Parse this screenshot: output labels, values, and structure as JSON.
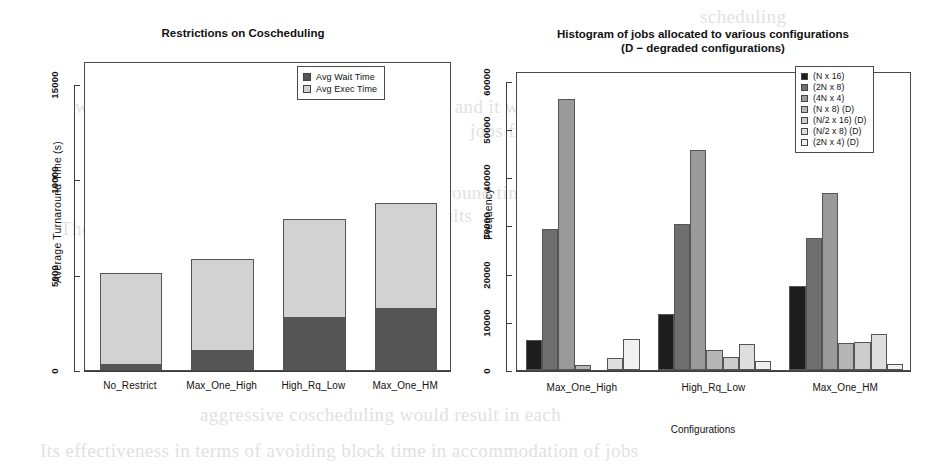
{
  "page": {
    "background_color": "#ffffff",
    "bleed_through_text": [
      {
        "text": "scheduling",
        "x": 700,
        "y": 6
      },
      {
        "text": "we wish to schedule should be more restrictive and it will stop al",
        "x": 75,
        "y": 96
      },
      {
        "text": "jobs from running",
        "x": 470,
        "y": 120
      },
      {
        "text": "We observed the average turnaround time performance",
        "x": 200,
        "y": 182
      },
      {
        "text": "results",
        "x": 420,
        "y": 205
      },
      {
        "text": "The cost of idling. Moreover, the",
        "x": 60,
        "y": 218
      },
      {
        "text": "aggressive coscheduling would result in each",
        "x": 200,
        "y": 404
      },
      {
        "text": "Its effectiveness in terms of avoiding block time in accommodation of jobs",
        "x": 40,
        "y": 440
      }
    ]
  },
  "chart_data": [
    {
      "id": "restrictions-on-coscheduling",
      "type": "bar",
      "subtype": "stacked",
      "title": "Restrictions on Coscheduling",
      "xlabel": "",
      "ylabel": "Average Turnaround Time (s)",
      "categories": [
        "No_Restrict",
        "Max_One_High",
        "High_Rq_Low",
        "Max_One_HM"
      ],
      "ylim": [
        0,
        16200
      ],
      "yticks": [
        0,
        5000,
        10000,
        15000
      ],
      "ytick_labels": [
        "0",
        "5000",
        "10000",
        "15000"
      ],
      "grid": false,
      "legend_position": "top-right",
      "series": [
        {
          "name": "Avg Wait Time",
          "color": "#555555",
          "values": [
            250,
            1000,
            2750,
            3200
          ]
        },
        {
          "name": "Avg Exec Time",
          "color": "#d2d2d2",
          "values": [
            4850,
            4800,
            5150,
            5550
          ]
        }
      ],
      "totals": [
        5100,
        5800,
        7900,
        8750
      ]
    },
    {
      "id": "histogram-jobs-configurations",
      "type": "bar",
      "subtype": "grouped",
      "title_line1": "Histogram of jobs allocated to various configurations",
      "title_line2": "(D − degraded configurations)",
      "xlabel": "Configurations",
      "ylabel": "Frequency",
      "categories": [
        "Max_One_High",
        "High_Rq_Low",
        "Max_One_HM"
      ],
      "ylim": [
        0,
        62000
      ],
      "yticks": [
        0,
        10000,
        20000,
        30000,
        40000,
        50000,
        60000
      ],
      "ytick_labels": [
        "0",
        "10000",
        "20000",
        "30000",
        "40000",
        "50000",
        "60000"
      ],
      "grid": false,
      "legend_position": "top-right",
      "series": [
        {
          "name": "(N x 16)",
          "color": "#1d1d1d",
          "values": [
            6200,
            11600,
            17400
          ]
        },
        {
          "name": "(2N x 8)",
          "color": "#6f6f6f",
          "values": [
            29200,
            30300,
            27300
          ]
        },
        {
          "name": "(4N x 4)",
          "color": "#9a9a9a",
          "values": [
            56200,
            45600,
            36800
          ]
        },
        {
          "name": "(N x 8) (D)",
          "color": "#b5b5b5",
          "values": [
            1000,
            4100,
            5600
          ]
        },
        {
          "name": "(N/2 x 16) (D)",
          "color": "#cccccc",
          "values": [
            0,
            2600,
            5900
          ]
        },
        {
          "name": "(N/2 x 8) (D)",
          "color": "#dedede",
          "values": [
            2500,
            5300,
            7500
          ]
        },
        {
          "name": "(2N x 4) (D)",
          "color": "#f0f0f0",
          "values": [
            6500,
            1800,
            1200
          ]
        }
      ]
    }
  ]
}
